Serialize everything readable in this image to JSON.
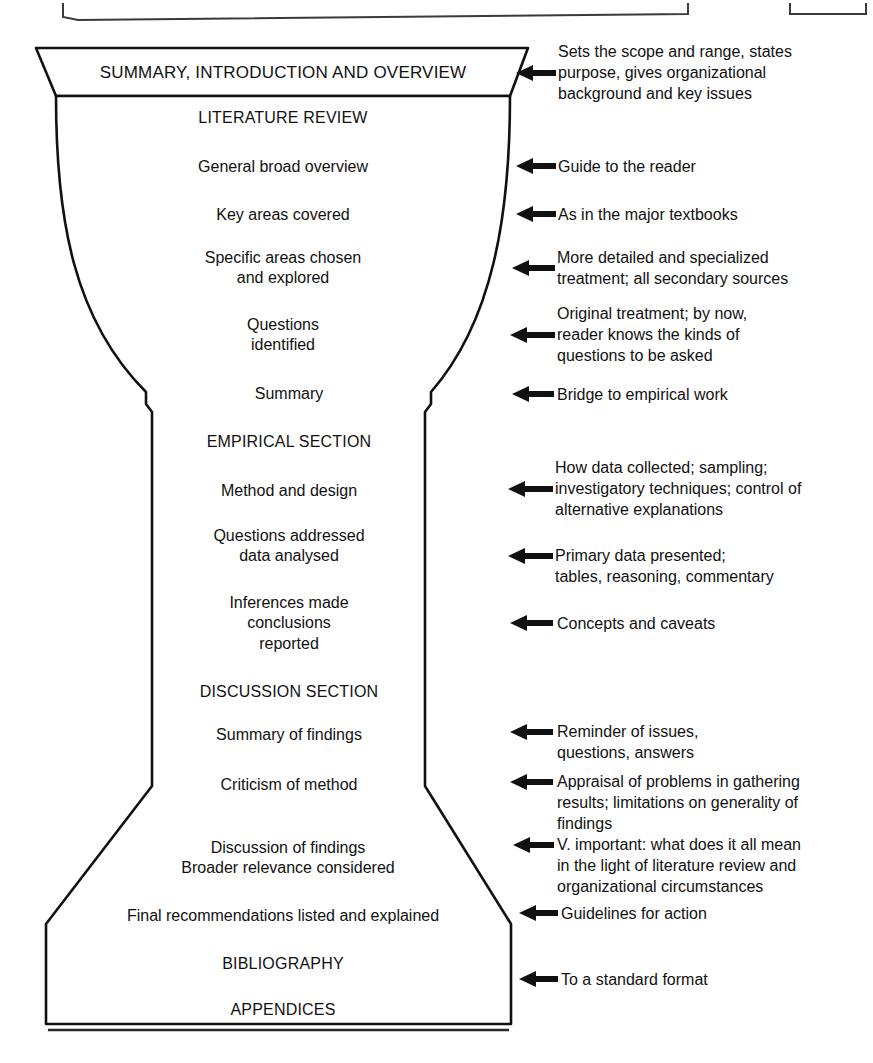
{
  "figure": {
    "type": "funnel-diagram",
    "title_absent": true,
    "shape_name": "report-structure-funnel",
    "background_color": "#ffffff",
    "line_color": "#111111"
  },
  "top_fragments": [
    {
      "name": "page-box-fragment-left"
    },
    {
      "name": "page-box-fragment-right"
    }
  ],
  "funnel": {
    "header_band": {
      "label": "SUMMARY, INTRODUCTION AND OVERVIEW"
    },
    "sections": [
      {
        "label": "LITERATURE REVIEW",
        "style": "caps"
      },
      {
        "label": "General broad overview",
        "style": "normal"
      },
      {
        "label": "Key areas covered",
        "style": "normal"
      },
      {
        "label": "Specific areas chosen\nand explored",
        "style": "normal"
      },
      {
        "label": "Questions\nidentified",
        "style": "normal"
      },
      {
        "label": "Summary",
        "style": "normal"
      },
      {
        "label": "EMPIRICAL SECTION",
        "style": "caps"
      },
      {
        "label": "Method and design",
        "style": "normal"
      },
      {
        "label": "Questions addressed\ndata analysed",
        "style": "normal"
      },
      {
        "label": "Inferences made\nconclusions\nreported",
        "style": "normal"
      },
      {
        "label": "DISCUSSION SECTION",
        "style": "caps"
      },
      {
        "label": "Summary of findings",
        "style": "normal"
      },
      {
        "label": "Criticism of method",
        "style": "normal"
      },
      {
        "label": "Discussion of findings\nBroader relevance considered",
        "style": "normal"
      },
      {
        "label": "Final recommendations listed and explained",
        "style": "normal"
      },
      {
        "label": "BIBLIOGRAPHY",
        "style": "caps"
      },
      {
        "label": "APPENDICES",
        "style": "caps"
      }
    ]
  },
  "annotations": [
    {
      "text": "Sets the scope and range, states\npurpose, gives organizational\nbackground and key issues"
    },
    {
      "text": "Guide to the reader"
    },
    {
      "text": "As in the major textbooks"
    },
    {
      "text": "More detailed and specialized\ntreatment; all secondary sources"
    },
    {
      "text": "Original treatment; by now,\nreader knows the kinds of\nquestions to be asked"
    },
    {
      "text": "Bridge to empirical work"
    },
    {
      "text": "How data collected; sampling;\ninvestigatory techniques; control of\nalternative explanations"
    },
    {
      "text": "Primary data presented;\ntables, reasoning, commentary"
    },
    {
      "text": "Concepts and caveats"
    },
    {
      "text": "Reminder of issues,\nquestions, answers"
    },
    {
      "text": "Appraisal of problems in gathering\nresults; limitations on generality of\nfindings"
    },
    {
      "text": "V. important: what does it all mean\nin the light of literature review and\norganizational circumstances"
    },
    {
      "text": "Guidelines for action"
    },
    {
      "text": "To a standard format"
    }
  ]
}
